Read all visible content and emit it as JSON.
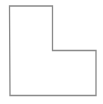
{
  "diagram": {
    "shape": "L-shaped polygon outline",
    "stroke_color": "#8a8a8a",
    "fill_color": "#ffffff",
    "stroke_width": 1.3,
    "points": [
      [
        9.5,
        6
      ],
      [
        52.5,
        6
      ],
      [
        52.5,
        50.5
      ],
      [
        96,
        50.5
      ],
      [
        96,
        95.5
      ],
      [
        10,
        95.5
      ]
    ]
  }
}
